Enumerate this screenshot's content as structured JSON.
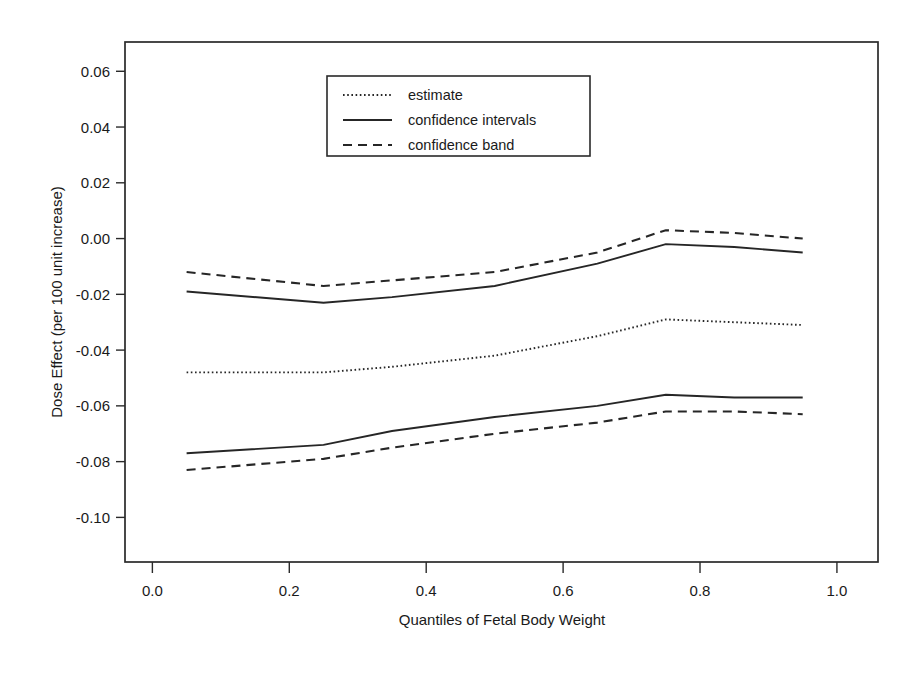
{
  "chart_data": {
    "type": "line",
    "title": "",
    "xlabel": "Quantiles of Fetal Body Weight",
    "ylabel": "Dose Effect (per 100 unit increase)",
    "xlim": [
      -0.04,
      1.06
    ],
    "ylim": [
      -0.116,
      0.0705
    ],
    "xticks": [
      0.0,
      0.2,
      0.4,
      0.6,
      0.8,
      1.0
    ],
    "xticklabels": [
      "0.0",
      "0.2",
      "0.4",
      "0.6",
      "0.8",
      "1.0"
    ],
    "yticks": [
      0.06,
      0.04,
      0.02,
      0.0,
      -0.02,
      -0.04,
      -0.06,
      -0.08,
      -0.1
    ],
    "yticklabels": [
      "0.06",
      "0.04",
      "0.02",
      "0.00",
      "-0.02",
      "-0.04",
      "-0.06",
      "-0.08",
      "-0.10"
    ],
    "grid": false,
    "legend_position": "upper-center-left",
    "x": [
      0.05,
      0.25,
      0.35,
      0.5,
      0.65,
      0.75,
      0.85,
      0.95
    ],
    "series": [
      {
        "name": "estimate",
        "style": "dotted",
        "values": [
          -0.048,
          -0.048,
          -0.046,
          -0.042,
          -0.035,
          -0.029,
          -0.03,
          -0.031
        ]
      },
      {
        "name": "confidence intervals upper",
        "style": "solid",
        "values": [
          -0.019,
          -0.023,
          -0.021,
          -0.017,
          -0.009,
          -0.002,
          -0.003,
          -0.005
        ]
      },
      {
        "name": "confidence intervals lower",
        "style": "solid",
        "values": [
          -0.077,
          -0.074,
          -0.069,
          -0.064,
          -0.06,
          -0.056,
          -0.057,
          -0.057
        ]
      },
      {
        "name": "confidence band upper",
        "style": "dashed",
        "values": [
          -0.012,
          -0.017,
          -0.015,
          -0.012,
          -0.005,
          0.003,
          0.002,
          0.0
        ]
      },
      {
        "name": "confidence band lower",
        "style": "dashed",
        "values": [
          -0.083,
          -0.079,
          -0.075,
          -0.07,
          -0.066,
          -0.062,
          -0.062,
          -0.063
        ]
      }
    ],
    "legend_entries": [
      {
        "label": "estimate",
        "style": "dotted"
      },
      {
        "label": "confidence intervals",
        "style": "solid"
      },
      {
        "label": "confidence band",
        "style": "dashed"
      }
    ],
    "colors": {
      "line": "#262626",
      "axis": "#2a2a2a",
      "background": "#ffffff"
    }
  }
}
